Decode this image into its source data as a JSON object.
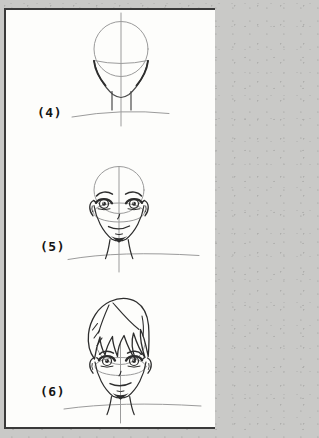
{
  "page": {
    "background_color": "#c9c9c7",
    "panel": {
      "background_color": "#fdfdfb",
      "border_color": "#3a3a3a"
    }
  },
  "colors": {
    "construction_line": "#9b9b9b",
    "ink_line": "#2d2d2d",
    "mid_line": "#4a4a4a",
    "label_text": "#141414"
  },
  "steps": [
    {
      "label": "(4)",
      "name": "head-construction",
      "description": "Skull circle with center line, eye line, jaw, neck and shoulder guide"
    },
    {
      "label": "(5)",
      "name": "facial-features",
      "description": "Eyebrows, eyes, ears, nose, mouth and chin added to the construction head"
    },
    {
      "label": "(6)",
      "name": "hair-added",
      "description": "Side-swept tousled hair drawn over the finished face"
    }
  ]
}
